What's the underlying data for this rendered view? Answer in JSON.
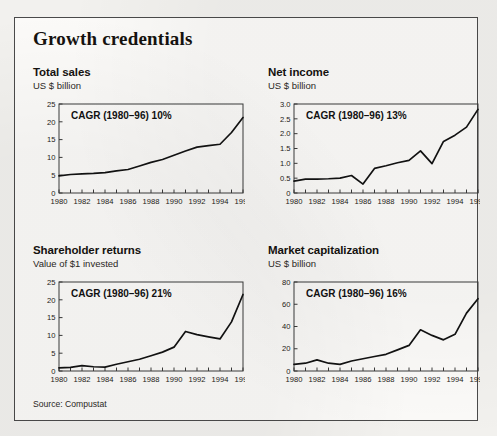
{
  "card": {
    "title": "Growth credentials",
    "source": "Source: Compustat"
  },
  "charts": [
    {
      "title": "Total sales",
      "subtitle": "US $ billion",
      "annotation": "CAGR (1980–96) 10%"
    },
    {
      "title": "Net income",
      "subtitle": "US $ billion",
      "annotation": "CAGR (1980–96) 13%"
    },
    {
      "title": "Shareholder returns",
      "subtitle": "Value of $1 invested",
      "annotation": "CAGR (1980–96) 21%"
    },
    {
      "title": "Market capitalization",
      "subtitle": "US $ billion",
      "annotation": "CAGR (1980–96) 16%"
    }
  ],
  "chart_data": [
    {
      "type": "line",
      "title": "Total sales",
      "subtitle": "US $ billion",
      "xlabel": "",
      "ylabel": "US $ billion",
      "annotation": "CAGR (1980–96) 10%",
      "xlim": [
        1980,
        1996
      ],
      "ylim": [
        0,
        25
      ],
      "yticks": [
        0,
        5,
        10,
        15,
        20,
        25
      ],
      "ytick_labels": [
        "0",
        "5",
        "10",
        "15",
        "20",
        "25"
      ],
      "xticks": [
        1980,
        1981,
        1982,
        1983,
        1984,
        1985,
        1986,
        1987,
        1988,
        1989,
        1990,
        1991,
        1992,
        1993,
        1994,
        1995,
        1996
      ],
      "xtick_labels": [
        "1980",
        "1982",
        "1984",
        "1986",
        "1988",
        "1990",
        "1992",
        "1994",
        "1996"
      ],
      "grid": false,
      "legend": "none",
      "x": [
        1980,
        1981,
        1982,
        1983,
        1984,
        1985,
        1986,
        1987,
        1988,
        1989,
        1990,
        1991,
        1992,
        1993,
        1994,
        1995,
        1996
      ],
      "values": [
        4.8,
        5.2,
        5.4,
        5.5,
        5.7,
        6.2,
        6.6,
        7.6,
        8.6,
        9.4,
        10.6,
        11.8,
        12.9,
        13.3,
        13.7,
        17.0,
        21.2
      ]
    },
    {
      "type": "line",
      "title": "Net income",
      "subtitle": "US $ billion",
      "xlabel": "",
      "ylabel": "US $ billion",
      "annotation": "CAGR (1980–96) 13%",
      "xlim": [
        1980,
        1996
      ],
      "ylim": [
        0,
        3.0
      ],
      "yticks": [
        0,
        0.5,
        1.0,
        1.5,
        2.0,
        2.5,
        3.0
      ],
      "ytick_labels": [
        "0",
        "0.5",
        "1.0",
        "1.5",
        "2.0",
        "2.5",
        "3.0"
      ],
      "xticks": [
        1980,
        1981,
        1982,
        1983,
        1984,
        1985,
        1986,
        1987,
        1988,
        1989,
        1990,
        1991,
        1992,
        1993,
        1994,
        1995,
        1996
      ],
      "xtick_labels": [
        "1980",
        "1982",
        "1984",
        "1986",
        "1988",
        "1990",
        "1992",
        "1994",
        "1996"
      ],
      "grid": false,
      "legend": "none",
      "x": [
        1980,
        1981,
        1982,
        1983,
        1984,
        1985,
        1986,
        1987,
        1988,
        1989,
        1990,
        1991,
        1992,
        1993,
        1994,
        1995,
        1996
      ],
      "values": [
        0.4,
        0.47,
        0.47,
        0.48,
        0.5,
        0.59,
        0.3,
        0.83,
        0.92,
        1.02,
        1.1,
        1.42,
        0.99,
        1.74,
        1.95,
        2.22,
        2.82
      ]
    },
    {
      "type": "line",
      "title": "Shareholder returns",
      "subtitle": "Value of $1 invested",
      "xlabel": "",
      "ylabel": "Value of $1 invested",
      "annotation": "CAGR (1980–96) 21%",
      "xlim": [
        1980,
        1996
      ],
      "ylim": [
        0,
        25
      ],
      "yticks": [
        0,
        5,
        10,
        15,
        20,
        25
      ],
      "ytick_labels": [
        "0",
        "5",
        "10",
        "15",
        "20",
        "25"
      ],
      "xticks": [
        1980,
        1981,
        1982,
        1983,
        1984,
        1985,
        1986,
        1987,
        1988,
        1989,
        1990,
        1991,
        1992,
        1993,
        1994,
        1995,
        1996
      ],
      "xtick_labels": [
        "1980",
        "1982",
        "1984",
        "1986",
        "1988",
        "1990",
        "1992",
        "1994",
        "1996"
      ],
      "grid": false,
      "legend": "none",
      "x": [
        1980,
        1981,
        1982,
        1983,
        1984,
        1985,
        1986,
        1987,
        1988,
        1989,
        1990,
        1991,
        1992,
        1993,
        1994,
        1995,
        1996
      ],
      "values": [
        0.9,
        1.0,
        1.5,
        1.2,
        1.1,
        1.9,
        2.6,
        3.3,
        4.3,
        5.3,
        6.7,
        11.1,
        10.2,
        9.6,
        9.0,
        13.8,
        21.5
      ]
    },
    {
      "type": "line",
      "title": "Market capitalization",
      "subtitle": "US $ billion",
      "xlabel": "",
      "ylabel": "US $ billion",
      "annotation": "CAGR (1980–96) 16%",
      "xlim": [
        1980,
        1996
      ],
      "ylim": [
        0,
        80
      ],
      "yticks": [
        0,
        20,
        40,
        60,
        80
      ],
      "ytick_labels": [
        "0",
        "20",
        "40",
        "60",
        "80"
      ],
      "xticks": [
        1980,
        1981,
        1982,
        1983,
        1984,
        1985,
        1986,
        1987,
        1988,
        1989,
        1990,
        1991,
        1992,
        1993,
        1994,
        1995,
        1996
      ],
      "xtick_labels": [
        "1980",
        "1982",
        "1984",
        "1986",
        "1988",
        "1990",
        "1992",
        "1994",
        "1996"
      ],
      "grid": false,
      "legend": "none",
      "x": [
        1980,
        1981,
        1982,
        1983,
        1984,
        1985,
        1986,
        1987,
        1988,
        1989,
        1990,
        1991,
        1992,
        1993,
        1994,
        1995,
        1996
      ],
      "values": [
        6,
        7,
        10,
        7,
        6,
        9,
        11,
        13,
        15,
        19,
        23,
        37,
        32,
        28,
        33,
        52,
        65
      ]
    }
  ]
}
